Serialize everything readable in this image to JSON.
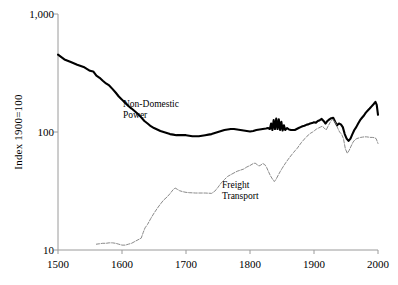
{
  "chart_data": {
    "type": "line",
    "title": "",
    "xlabel": "",
    "ylabel": "Index 1900=100",
    "xlim": [
      1500,
      2000
    ],
    "ylim": [
      10,
      1000
    ],
    "yscale": "log",
    "grid": false,
    "legend_position": "inline-annotation",
    "xticks": [
      1500,
      1600,
      1700,
      1800,
      1900,
      2000
    ],
    "xtick_labels": [
      "1500",
      "1600",
      "1700",
      "1800",
      "1900",
      "2000"
    ],
    "yticks": [
      10,
      100,
      1000
    ],
    "ytick_labels": [
      "10",
      "100",
      "1,000"
    ],
    "series": [
      {
        "name": "Non-Domestic Power",
        "label_line1": "Non-Domestic",
        "label_line2": "Power",
        "color": "#000000",
        "linewidth": 2.1,
        "style": "solid",
        "x": [
          1500,
          1510,
          1520,
          1530,
          1540,
          1550,
          1555,
          1560,
          1565,
          1570,
          1575,
          1580,
          1585,
          1590,
          1595,
          1600,
          1605,
          1610,
          1615,
          1620,
          1625,
          1630,
          1635,
          1640,
          1645,
          1650,
          1655,
          1660,
          1665,
          1670,
          1675,
          1680,
          1685,
          1690,
          1695,
          1700,
          1705,
          1710,
          1715,
          1720,
          1725,
          1730,
          1735,
          1740,
          1745,
          1750,
          1755,
          1760,
          1765,
          1770,
          1775,
          1780,
          1785,
          1790,
          1795,
          1800,
          1805,
          1810,
          1815,
          1820,
          1825,
          1828,
          1831,
          1833,
          1835,
          1837,
          1839,
          1841,
          1843,
          1845,
          1847,
          1849,
          1851,
          1853,
          1855,
          1858,
          1861,
          1864,
          1867,
          1870,
          1873,
          1876,
          1879,
          1882,
          1885,
          1888,
          1891,
          1894,
          1897,
          1900,
          1903,
          1906,
          1909,
          1912,
          1915,
          1918,
          1921,
          1924,
          1927,
          1930,
          1933,
          1936,
          1939,
          1942,
          1945,
          1948,
          1951,
          1954,
          1957,
          1960,
          1963,
          1966,
          1969,
          1972,
          1975,
          1978,
          1981,
          1984,
          1987,
          1990,
          1993,
          1996,
          1998,
          2000
        ],
        "y": [
          452,
          412,
          392,
          372,
          356,
          330,
          326,
          300,
          288,
          272,
          258,
          248,
          232,
          216,
          200,
          188,
          176,
          166,
          158,
          150,
          142,
          133,
          124,
          118,
          112,
          108,
          105,
          102,
          100,
          98,
          96,
          95,
          94,
          94,
          94,
          94,
          93,
          92,
          92,
          92,
          93,
          94,
          95,
          96,
          98,
          100,
          102,
          104,
          105,
          106,
          106,
          105,
          104,
          103,
          102,
          101,
          102,
          104,
          105,
          106,
          107,
          108,
          106,
          118,
          104,
          126,
          106,
          130,
          106,
          128,
          104,
          122,
          103,
          114,
          104,
          108,
          105,
          104,
          104,
          104,
          106,
          108,
          110,
          112,
          113,
          115,
          116,
          118,
          119,
          121,
          120,
          124,
          126,
          129,
          124,
          118,
          124,
          128,
          131,
          132,
          122,
          114,
          118,
          116,
          110,
          96,
          88,
          84,
          88,
          96,
          104,
          110,
          118,
          126,
          132,
          138,
          146,
          152,
          158,
          165,
          172,
          180,
          170,
          140
        ],
        "note": "Index of non-domestic power consumption, 1900 = 100. Starts ~450 in 1500, declines to ~95 by 1640, flat through 1800, volatile spike near 1830-1850, rises to ~180 by 1998 then falls to ~140."
      },
      {
        "name": "Freight Transport",
        "label_line1": "Freight",
        "label_line2": "Transport",
        "color": "#8a8a8a",
        "linewidth": 1.0,
        "style": "dashed",
        "x": [
          1560,
          1565,
          1570,
          1575,
          1580,
          1585,
          1590,
          1595,
          1600,
          1605,
          1610,
          1615,
          1620,
          1625,
          1630,
          1633,
          1636,
          1640,
          1645,
          1650,
          1655,
          1660,
          1665,
          1670,
          1675,
          1680,
          1683,
          1686,
          1690,
          1695,
          1700,
          1705,
          1710,
          1715,
          1720,
          1725,
          1730,
          1735,
          1740,
          1745,
          1750,
          1755,
          1760,
          1765,
          1770,
          1775,
          1780,
          1785,
          1790,
          1795,
          1800,
          1805,
          1808,
          1811,
          1814,
          1817,
          1820,
          1823,
          1826,
          1829,
          1832,
          1835,
          1838,
          1841,
          1844,
          1847,
          1850,
          1853,
          1856,
          1859,
          1862,
          1865,
          1868,
          1871,
          1874,
          1877,
          1880,
          1883,
          1886,
          1889,
          1892,
          1895,
          1898,
          1901,
          1904,
          1907,
          1910,
          1913,
          1916,
          1919,
          1922,
          1925,
          1928,
          1931,
          1934,
          1937,
          1940,
          1943,
          1946,
          1949,
          1952,
          1955,
          1958,
          1961,
          1964,
          1967,
          1970,
          1973,
          1976,
          1979,
          1982,
          1985,
          1988,
          1991,
          1994,
          1997,
          2000
        ],
        "y": [
          11.2,
          11.3,
          11.4,
          11.4,
          11.5,
          11.5,
          11.4,
          11.2,
          11.0,
          11.0,
          11.2,
          11.4,
          11.8,
          12.2,
          12.6,
          14.0,
          15.4,
          16.5,
          18.5,
          20.5,
          22.5,
          24.5,
          26.5,
          28.0,
          30.0,
          32.5,
          33.5,
          32.8,
          31.8,
          31.2,
          30.8,
          30.6,
          30.5,
          30.4,
          30.4,
          30.4,
          30.4,
          30.3,
          30.2,
          31.5,
          34.0,
          37.0,
          39.5,
          42.0,
          43.5,
          45.0,
          46.5,
          47.5,
          48.5,
          50.5,
          52.0,
          54.0,
          54.5,
          53.0,
          51.5,
          52.5,
          54.0,
          53.0,
          50.0,
          46.0,
          42.5,
          40.0,
          38.0,
          40.0,
          43.0,
          46.0,
          49.0,
          52.0,
          55.0,
          58.0,
          61.0,
          64.0,
          67.0,
          70.0,
          73.0,
          77.0,
          81.0,
          85.0,
          88.0,
          92.0,
          95.0,
          98.0,
          100.0,
          103.0,
          106.0,
          108.0,
          110.0,
          112.0,
          108.0,
          104.0,
          112.0,
          120.0,
          128.0,
          126.0,
          118.0,
          108.0,
          100.0,
          96.0,
          88.0,
          72.0,
          66.0,
          70.0,
          76.0,
          82.0,
          86.0,
          88.0,
          89.0,
          90.0,
          90.5,
          91.0,
          91.0,
          90.5,
          90.0,
          90.0,
          89.5,
          88.0,
          80.0
        ],
        "note": "Index of freight transport, 1900 = 100. Starts ~11 in 1560, flat to 1625, rises steeply to ~33 by 1685, plateau ~30 to 1740, rises through 1800s with a dip near 1835, peaks ~128 around 1928, collapses to ~66 by 1952, recovers to ~90."
      }
    ]
  },
  "axes": {
    "ylabel_text": "Index 1900=100",
    "ytick_labels": [
      "1,000",
      "100",
      "10"
    ],
    "xtick_labels": [
      "1500",
      "1600",
      "1700",
      "1800",
      "1900",
      "2000"
    ]
  },
  "annotations": {
    "nondomestic_line1": "Non-Domestic",
    "nondomestic_line2": "Power",
    "freight_line1": "Freight",
    "freight_line2": "Transport"
  },
  "colors": {
    "axis": "#9a9a9a",
    "nondomestic": "#000000",
    "freight": "#8a8a8a",
    "text": "#000000",
    "background": "#ffffff"
  }
}
